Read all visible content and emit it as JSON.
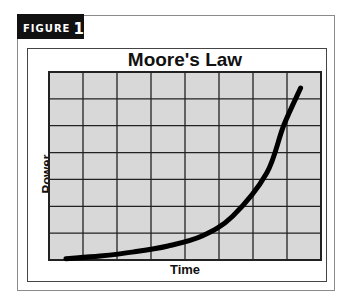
{
  "figure": {
    "tab_word": "FIGURE",
    "tab_number": "1"
  },
  "colors": {
    "plot_background": "#d8d8d8",
    "grid_line": "#222222",
    "curve": "#000000",
    "tab_background": "#111111",
    "tab_text": "#ffffff"
  },
  "chart_data": {
    "type": "line",
    "title": "Moore's Law",
    "xlabel": "Time",
    "ylabel": "Power",
    "grid": true,
    "grid_columns": 8,
    "grid_rows": 7,
    "x_ticks_labeled": false,
    "y_ticks_labeled": false,
    "xlim": [
      0,
      8
    ],
    "ylim": [
      0,
      7
    ],
    "legend": null,
    "series": [
      {
        "name": "Power",
        "x": [
          0.5,
          1.5,
          2.5,
          3.5,
          4.5,
          5.4,
          6.4,
          6.9,
          7.4
        ],
        "y": [
          0.05,
          0.15,
          0.3,
          0.52,
          0.89,
          1.63,
          3.23,
          5.0,
          6.4
        ]
      }
    ]
  }
}
